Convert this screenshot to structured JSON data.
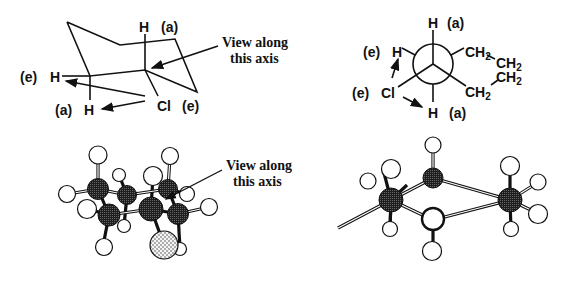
{
  "chair": {
    "h_axial_top": "H",
    "a_top": "(a)",
    "e_left": "(e)",
    "h_eq_left": "H",
    "a_bottom": "(a)",
    "h_axial_bottom": "H",
    "cl": "Cl",
    "e_cl": "(e)",
    "view_line1": "View along",
    "view_line2": "this axis"
  },
  "newman": {
    "h_top": "H",
    "a_top": "(a)",
    "e_h": "(e)",
    "h_left": "H",
    "e_cl": "(e)",
    "cl": "Cl",
    "h_bottom": "H",
    "a_bottom": "(a)",
    "ch2_1": "CH",
    "ch2_2": "CH",
    "ch2_3": "CH",
    "ch2_4": "CH",
    "sub2": "2"
  },
  "ballstick_left": {
    "view_line1": "View along",
    "view_line2": "this axis"
  },
  "colors": {
    "ink": "#111111",
    "carbon": "#2a2a2a",
    "hydrogen": "#ffffff",
    "chlorine": "#e8e8e8"
  }
}
